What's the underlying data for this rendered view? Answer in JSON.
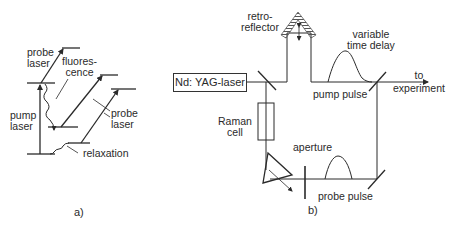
{
  "figure_a": {
    "caption": "a)",
    "labels": {
      "probe_laser_top_1": "probe",
      "probe_laser_top_2": "laser",
      "fluorescence_1": "fluores-",
      "fluorescence_2": "cence",
      "pump_laser_1": "pump",
      "pump_laser_2": "laser",
      "probe_laser_right_1": "probe",
      "probe_laser_right_2": "laser",
      "relaxation": "relaxation"
    }
  },
  "figure_b": {
    "caption": "b)",
    "labels": {
      "retroreflector_1": "retro-",
      "retroreflector_2": "reflector",
      "variable_delay_1": "variable",
      "variable_delay_2": "time delay",
      "nd_yag_laser": "Nd: YAG-laser",
      "to_experiment_1": "to",
      "to_experiment_2": "experiment",
      "pump_pulse": "pump pulse",
      "raman_cell_1": "Raman",
      "raman_cell_2": "cell",
      "aperture": "aperture",
      "probe_pulse": "probe pulse"
    }
  },
  "colors": {
    "line": "#2a2a2a",
    "background": "#ffffff"
  }
}
